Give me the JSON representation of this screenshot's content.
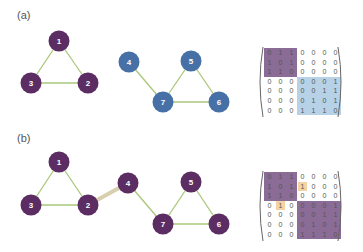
{
  "colors": {
    "purple": "#5b2d63",
    "blue": "#4670a6",
    "edge_green": "#a9c77a",
    "edge_bridge": "#d8cfae",
    "matrix_purple": "#8a6c96",
    "matrix_blue": "#b7d1e6",
    "matrix_orange": "#f4d3a3"
  },
  "panels": [
    {
      "label": "(a)",
      "nodes": [
        {
          "id": "1",
          "x": 59,
          "y": 41,
          "color": "purple"
        },
        {
          "id": "2",
          "x": 88,
          "y": 83,
          "color": "purple"
        },
        {
          "id": "3",
          "x": 31,
          "y": 83,
          "color": "purple"
        },
        {
          "id": "4",
          "x": 129,
          "y": 62,
          "color": "blue"
        },
        {
          "id": "5",
          "x": 191,
          "y": 61,
          "color": "blue"
        },
        {
          "id": "6",
          "x": 219,
          "y": 102,
          "color": "blue"
        },
        {
          "id": "7",
          "x": 163,
          "y": 102,
          "color": "blue"
        }
      ],
      "edges": [
        {
          "from": "1",
          "to": "2",
          "type": "normal"
        },
        {
          "from": "1",
          "to": "3",
          "type": "normal"
        },
        {
          "from": "2",
          "to": "3",
          "type": "normal"
        },
        {
          "from": "4",
          "to": "7",
          "type": "normal"
        },
        {
          "from": "5",
          "to": "7",
          "type": "normal"
        },
        {
          "from": "5",
          "to": "6",
          "type": "normal"
        },
        {
          "from": "6",
          "to": "7",
          "type": "normal"
        }
      ],
      "matrix": {
        "rows": [
          [
            "0",
            "1",
            "1",
            "0",
            "0",
            "0",
            "0"
          ],
          [
            "1",
            "0",
            "1",
            "0",
            "0",
            "0",
            "0"
          ],
          [
            "1",
            "1",
            "0",
            "0",
            "0",
            "0",
            "0"
          ],
          [
            "0",
            "0",
            "0",
            "0",
            "0",
            "0",
            "1"
          ],
          [
            "0",
            "0",
            "0",
            "0",
            "0",
            "1",
            "1"
          ],
          [
            "0",
            "0",
            "0",
            "0",
            "1",
            "0",
            "1"
          ],
          [
            "0",
            "0",
            "0",
            "1",
            "1",
            "1",
            "0"
          ]
        ],
        "blocks": [
          {
            "r0": 0,
            "c0": 0,
            "r1": 2,
            "c1": 2,
            "color": "matrix_purple"
          },
          {
            "r0": 3,
            "c0": 3,
            "r1": 6,
            "c1": 6,
            "color": "matrix_blue"
          }
        ],
        "highlights": []
      }
    },
    {
      "label": "(b)",
      "nodes": [
        {
          "id": "1",
          "x": 59,
          "y": 162,
          "color": "purple"
        },
        {
          "id": "2",
          "x": 88,
          "y": 205,
          "color": "purple"
        },
        {
          "id": "3",
          "x": 31,
          "y": 205,
          "color": "purple"
        },
        {
          "id": "4",
          "x": 128,
          "y": 183,
          "color": "purple"
        },
        {
          "id": "5",
          "x": 191,
          "y": 182,
          "color": "purple"
        },
        {
          "id": "6",
          "x": 219,
          "y": 224,
          "color": "purple"
        },
        {
          "id": "7",
          "x": 163,
          "y": 224,
          "color": "purple"
        }
      ],
      "edges": [
        {
          "from": "1",
          "to": "2",
          "type": "normal"
        },
        {
          "from": "1",
          "to": "3",
          "type": "normal"
        },
        {
          "from": "2",
          "to": "3",
          "type": "normal"
        },
        {
          "from": "2",
          "to": "4",
          "type": "bridge"
        },
        {
          "from": "4",
          "to": "7",
          "type": "normal"
        },
        {
          "from": "5",
          "to": "7",
          "type": "normal"
        },
        {
          "from": "5",
          "to": "6",
          "type": "normal"
        },
        {
          "from": "6",
          "to": "7",
          "type": "normal"
        }
      ],
      "matrix": {
        "rows": [
          [
            "0",
            "1",
            "1",
            "0",
            "0",
            "0",
            "0"
          ],
          [
            "1",
            "0",
            "1",
            "1",
            "0",
            "0",
            "0"
          ],
          [
            "1",
            "1",
            "0",
            "0",
            "0",
            "0",
            "0"
          ],
          [
            "0",
            "1",
            "0",
            "0",
            "0",
            "0",
            "1"
          ],
          [
            "0",
            "0",
            "0",
            "0",
            "0",
            "1",
            "1"
          ],
          [
            "0",
            "0",
            "0",
            "0",
            "1",
            "0",
            "1"
          ],
          [
            "0",
            "0",
            "0",
            "1",
            "1",
            "1",
            "0"
          ]
        ],
        "blocks": [
          {
            "r0": 0,
            "c0": 0,
            "r1": 2,
            "c1": 2,
            "color": "matrix_purple"
          },
          {
            "r0": 3,
            "c0": 3,
            "r1": 6,
            "c1": 6,
            "color": "matrix_purple"
          }
        ],
        "highlights": [
          {
            "r": 1,
            "c": 3,
            "color": "matrix_orange"
          },
          {
            "r": 3,
            "c": 1,
            "color": "matrix_orange"
          }
        ]
      }
    }
  ]
}
